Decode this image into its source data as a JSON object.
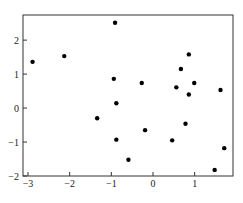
{
  "chart_data": {
    "type": "scatter",
    "title": "",
    "xlabel": "",
    "ylabel": "",
    "xlim": [
      -3.12,
      1.92
    ],
    "ylim": [
      -2,
      2.74
    ],
    "grid": false,
    "legend": null,
    "x_ticks": [
      -3,
      -2,
      -1,
      0,
      1
    ],
    "x_tick_labels": [
      "−3",
      "−2",
      "−1",
      "0",
      "1"
    ],
    "y_ticks": [
      -2,
      -1,
      0,
      1,
      2
    ],
    "y_tick_labels": [
      "−2",
      "−1",
      "0",
      "1",
      "2"
    ],
    "marker_color": "#000000",
    "points": [
      {
        "x": -2.89,
        "y": 1.36
      },
      {
        "x": -2.13,
        "y": 1.53
      },
      {
        "x": -0.91,
        "y": 2.51
      },
      {
        "x": -0.94,
        "y": 0.86
      },
      {
        "x": -0.88,
        "y": 0.14
      },
      {
        "x": -1.34,
        "y": -0.3
      },
      {
        "x": -0.19,
        "y": -0.65
      },
      {
        "x": -0.88,
        "y": -0.93
      },
      {
        "x": -0.59,
        "y": -1.52
      },
      {
        "x": 0.86,
        "y": 1.58
      },
      {
        "x": 0.67,
        "y": 1.15
      },
      {
        "x": -0.27,
        "y": 0.74
      },
      {
        "x": 0.99,
        "y": 0.74
      },
      {
        "x": 0.56,
        "y": 0.61
      },
      {
        "x": 0.86,
        "y": 0.4
      },
      {
        "x": 1.62,
        "y": 0.53
      },
      {
        "x": 0.78,
        "y": -0.46
      },
      {
        "x": 0.46,
        "y": -0.95
      },
      {
        "x": 1.71,
        "y": -1.18
      },
      {
        "x": 1.48,
        "y": -1.82
      }
    ]
  }
}
